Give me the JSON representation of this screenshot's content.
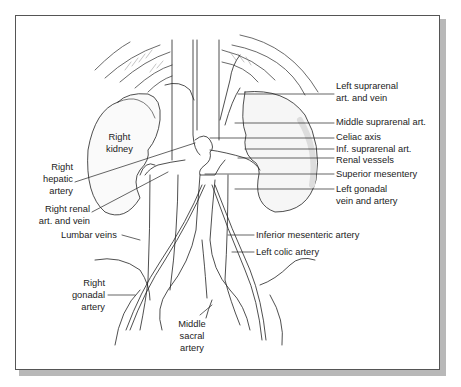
{
  "figure": {
    "labels": {
      "right_kidney": [
        "Right",
        "kidney"
      ],
      "right_hepatic_artery": [
        "Right",
        "hepatic",
        "artery"
      ],
      "right_renal": [
        "Right renal",
        "art. and vein"
      ],
      "lumbar_veins": [
        "Lumbar veins"
      ],
      "right_gonadal_artery": [
        "Right",
        "gonadal",
        "artery"
      ],
      "middle_sacral_artery": [
        "Middle",
        "sacral",
        "artery"
      ],
      "left_suprarenal": [
        "Left suprarenal",
        "art. and vein"
      ],
      "middle_suprarenal": [
        "Middle suprarenal art."
      ],
      "celiac_axis": [
        "Celiac axis"
      ],
      "inf_suprarenal": [
        "Inf. suprarenal art."
      ],
      "renal_vessels": [
        "Renal vessels"
      ],
      "superior_mesentery": [
        "Superior mesentery"
      ],
      "left_gonadal": [
        "Left gonadal",
        "vein and artery"
      ],
      "inferior_mesenteric": [
        "Inferior mesenteric artery"
      ],
      "left_colic": [
        "Left colic artery"
      ]
    }
  },
  "colors": {
    "ink": "#222222",
    "frame_border": "#555555",
    "shadow": "#b8b8b8",
    "kidney_shade": "#e6e6e6"
  }
}
